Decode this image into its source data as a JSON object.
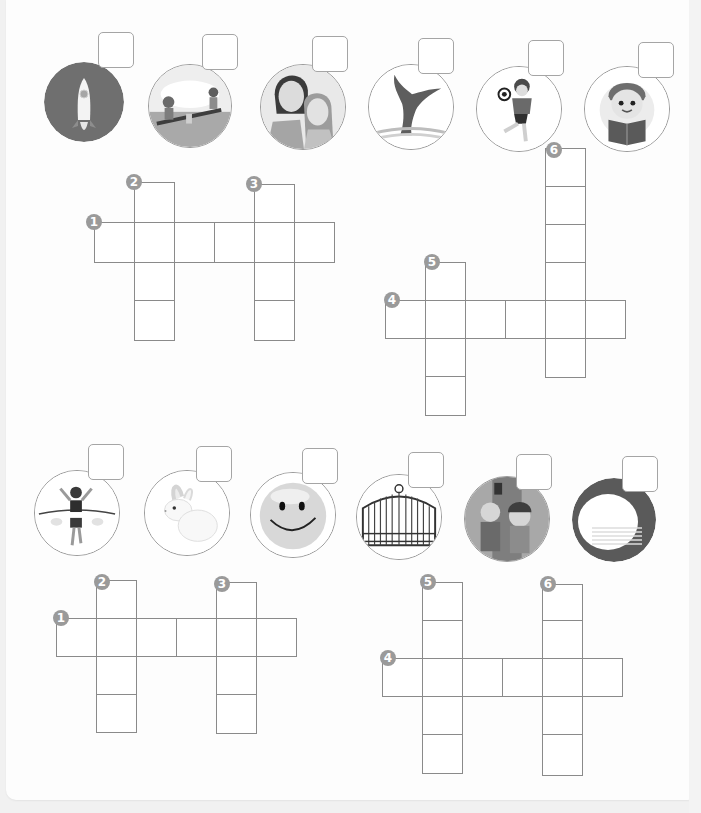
{
  "colors": {
    "background": "#f1f1f1",
    "sheet": "#fdfdfd",
    "grid_line": "#8a8a8a",
    "badge": "#9a9a9a",
    "answer_box_border": "#a5a5a5"
  },
  "puzzles": [
    {
      "id": "puzzle-1",
      "pictures": [
        {
          "name": "rocket",
          "answer": ""
        },
        {
          "name": "seesaw",
          "answer": ""
        },
        {
          "name": "mother-and-daughter",
          "answer": ""
        },
        {
          "name": "whale-tail",
          "answer": ""
        },
        {
          "name": "boy-kicking-ball",
          "answer": ""
        },
        {
          "name": "boy-reading-book",
          "answer": ""
        }
      ],
      "clue_numbers": [
        "1",
        "2",
        "3",
        "4",
        "5",
        "6"
      ]
    },
    {
      "id": "puzzle-2",
      "pictures": [
        {
          "name": "runner-finish-line",
          "answer": ""
        },
        {
          "name": "rabbit",
          "answer": ""
        },
        {
          "name": "smiley-face",
          "answer": ""
        },
        {
          "name": "iron-gate",
          "answer": ""
        },
        {
          "name": "kids-at-door",
          "answer": ""
        },
        {
          "name": "plates",
          "answer": ""
        }
      ],
      "clue_numbers": [
        "1",
        "2",
        "3",
        "4",
        "5",
        "6"
      ]
    }
  ]
}
